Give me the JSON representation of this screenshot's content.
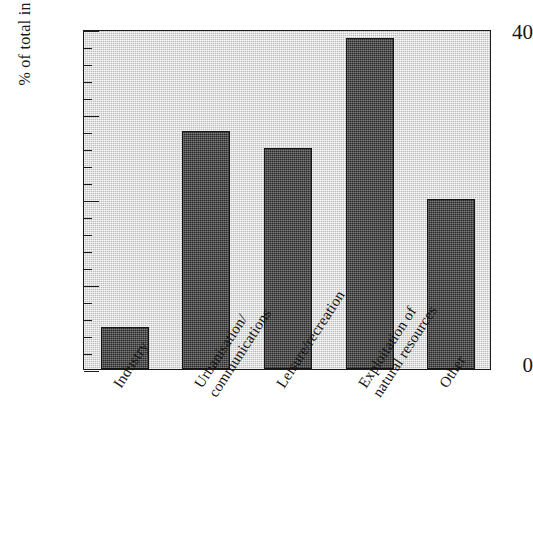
{
  "chart_data": {
    "type": "bar",
    "title": "",
    "xlabel": "",
    "ylabel": "% of total in category",
    "categories": [
      "Industry",
      "Urbanisation/\ncommunications",
      "Leisure/recreation",
      "Exploitation of\nnatural resources",
      "Other"
    ],
    "values": [
      5,
      28,
      26,
      39,
      20
    ],
    "ylim": [
      0,
      40
    ],
    "ytick_labels": [
      "0",
      "40"
    ],
    "ytick_values": [
      0,
      40
    ],
    "major_tick_interval": 10,
    "minor_tick_interval": 2,
    "grid": false,
    "legend": "none",
    "bar_color": "#4a4a4a",
    "plot_background": "#d2d2d2",
    "axis_color": "#1a1a1a"
  },
  "axis": {
    "y_label": "% of total in category",
    "y_max_label": "40",
    "y_min_label": "0"
  },
  "categories": [
    {
      "line1": "Industry",
      "line2": ""
    },
    {
      "line1": "Urbanisation/",
      "line2": "communications"
    },
    {
      "line1": "Leisure/recreation",
      "line2": ""
    },
    {
      "line1": "Exploitation of",
      "line2": "natural resources"
    },
    {
      "line1": "Other",
      "line2": ""
    }
  ]
}
